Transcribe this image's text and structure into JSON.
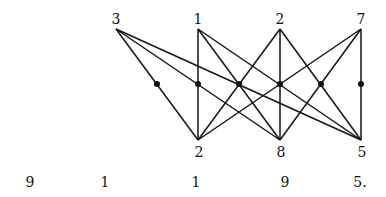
{
  "diagram": {
    "type": "bipartite-graph",
    "top_nodes": [
      {
        "id": "t3",
        "label": "3",
        "x": 116,
        "y": 29
      },
      {
        "id": "t1",
        "label": "1",
        "x": 198,
        "y": 29
      },
      {
        "id": "t2",
        "label": "2",
        "x": 280,
        "y": 29
      },
      {
        "id": "t7",
        "label": "7",
        "x": 361,
        "y": 29
      }
    ],
    "bottom_nodes": [
      {
        "id": "b2",
        "label": "2",
        "x": 198,
        "y": 140
      },
      {
        "id": "b8",
        "label": "8",
        "x": 280,
        "y": 140
      },
      {
        "id": "b5",
        "label": "5",
        "x": 361,
        "y": 140
      }
    ],
    "edges": [
      [
        "t3",
        "b2"
      ],
      [
        "t3",
        "b8"
      ],
      [
        "t3",
        "b5"
      ],
      [
        "t1",
        "b2"
      ],
      [
        "t1",
        "b8"
      ],
      [
        "t1",
        "b5"
      ],
      [
        "t2",
        "b2"
      ],
      [
        "t2",
        "b8"
      ],
      [
        "t2",
        "b5"
      ],
      [
        "t7",
        "b2"
      ],
      [
        "t7",
        "b8"
      ],
      [
        "t7",
        "b5"
      ]
    ],
    "middle_dots": [
      {
        "x": 157,
        "y": 84
      },
      {
        "x": 198,
        "y": 84
      },
      {
        "x": 239,
        "y": 84
      },
      {
        "x": 280,
        "y": 84
      },
      {
        "x": 321,
        "y": 84
      },
      {
        "x": 361,
        "y": 84
      }
    ],
    "bottom_row": [
      {
        "label": "9",
        "x": 30
      },
      {
        "label": "1",
        "x": 105
      },
      {
        "label": "1",
        "x": 196
      },
      {
        "label": "9",
        "x": 285
      },
      {
        "label": "5.",
        "x": 358
      }
    ],
    "bottom_row_y": 187
  }
}
